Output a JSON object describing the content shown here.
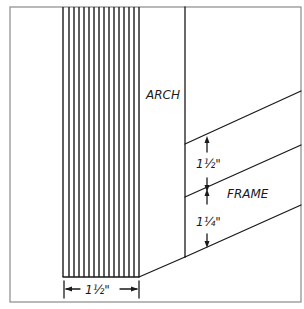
{
  "labels": {
    "arch": "ARCH",
    "frame": "FRAME",
    "dim_bottom": "1½\"",
    "dim_upper": "1½\"",
    "dim_lower": "1¼\""
  },
  "colors": {
    "ink": "#1a1a1a",
    "border": "#8a8a8a",
    "background": "#ffffff"
  }
}
